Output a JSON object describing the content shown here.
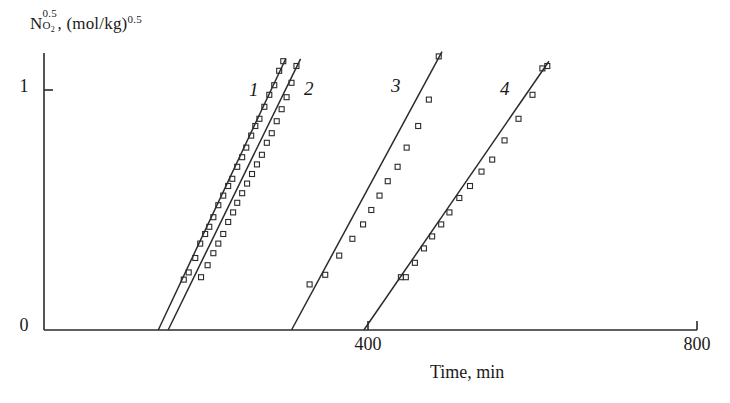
{
  "figure": {
    "background_color": "#ffffff",
    "ink_color": "#2b2b2b"
  },
  "axes": {
    "y_title_parts": {
      "symbol": "N",
      "sup": "0.5",
      "sub": "O",
      "sub_index": "2",
      "separator": ", ",
      "unit_open": "(mol/kg)",
      "unit_sup": "0.5"
    },
    "y_title_plain": "N_O2^0.5, (mol/kg)^0.5",
    "x_title": "Time, min",
    "y_ticks": [
      "0",
      "1"
    ],
    "x_ticks": [
      "400",
      "800"
    ]
  },
  "series_labels": {
    "s1": "1",
    "s2": "2",
    "s3": "3",
    "s4": "4"
  },
  "chart_data": {
    "type": "scatter",
    "title": "",
    "xlabel": "Time, min",
    "ylabel": "N_O2^0.5, (mol/kg)^0.5",
    "xlim": [
      0,
      850
    ],
    "ylim": [
      0,
      1.22
    ],
    "x_ticks": [
      400,
      800
    ],
    "y_ticks": [
      0,
      1
    ],
    "grid": false,
    "legend": "inline-numeric-labels",
    "marker": "open-square",
    "marker_size_px": 5,
    "series": [
      {
        "name": "1",
        "label_position": [
          195,
          1.13
        ],
        "fit_line": {
          "x": [
            145,
            300
          ],
          "y": [
            0.0,
            1.13
          ]
        },
        "points_x": [
          176,
          182,
          190,
          196,
          202,
          207,
          212,
          218,
          224,
          230,
          235,
          241,
          247,
          252,
          258,
          263,
          268,
          274,
          280,
          286,
          292,
          297
        ],
        "points_y": [
          0.21,
          0.24,
          0.3,
          0.36,
          0.4,
          0.43,
          0.47,
          0.52,
          0.56,
          0.6,
          0.63,
          0.68,
          0.72,
          0.76,
          0.81,
          0.85,
          0.88,
          0.93,
          0.98,
          1.02,
          1.08,
          1.12
        ]
      },
      {
        "name": "2",
        "label_position": [
          262,
          1.12
        ],
        "fit_line": {
          "x": [
            157,
            318
          ],
          "y": [
            0.0,
            1.13
          ]
        },
        "points_x": [
          197,
          205,
          212,
          218,
          224,
          230,
          236,
          241,
          247,
          253,
          259,
          265,
          271,
          277,
          283,
          289,
          295,
          301,
          307,
          313
        ],
        "points_y": [
          0.22,
          0.27,
          0.32,
          0.36,
          0.4,
          0.45,
          0.49,
          0.53,
          0.57,
          0.61,
          0.65,
          0.69,
          0.73,
          0.78,
          0.82,
          0.87,
          0.92,
          0.97,
          1.03,
          1.1
        ]
      },
      {
        "name": "3",
        "label_position": [
          422,
          1.16
        ],
        "fit_line": {
          "x": [
            307,
            490
          ],
          "y": [
            0.0,
            1.16
          ]
        },
        "points_x": [
          329,
          348,
          365,
          381,
          394,
          404,
          414,
          424,
          436,
          447,
          461,
          474,
          486
        ],
        "points_y": [
          0.19,
          0.23,
          0.31,
          0.38,
          0.44,
          0.5,
          0.56,
          0.62,
          0.68,
          0.76,
          0.85,
          0.96,
          1.14
        ]
      },
      {
        "name": "4",
        "label_position": [
          555,
          1.12
        ],
        "fit_line": {
          "x": [
            395,
            620
          ],
          "y": [
            0.0,
            1.12
          ]
        },
        "points_x": [
          440,
          446,
          457,
          468,
          478,
          489,
          499,
          511,
          524,
          538,
          551,
          566,
          583,
          600,
          612,
          618
        ],
        "points_y": [
          0.22,
          0.22,
          0.28,
          0.34,
          0.39,
          0.44,
          0.49,
          0.55,
          0.6,
          0.66,
          0.71,
          0.79,
          0.88,
          0.98,
          1.09,
          1.1
        ]
      }
    ]
  }
}
